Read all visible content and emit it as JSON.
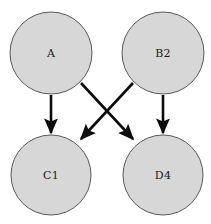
{
  "diagram": {
    "type": "directed-graph",
    "title": "",
    "background_color": "#ffffff",
    "node_fill_color": "#d7d7d7",
    "node_stroke_color": "#5a5a5a",
    "edge_color": "#0d0d0d",
    "label_color": "#1a1a1a",
    "nodes": [
      {
        "id": "A",
        "label": "A",
        "cx": 51,
        "cy": 53,
        "r": 41
      },
      {
        "id": "B2",
        "label": "B2",
        "cx": 163,
        "cy": 53,
        "r": 41
      },
      {
        "id": "C1",
        "label": "C1",
        "cx": 51,
        "cy": 175,
        "r": 40
      },
      {
        "id": "D4",
        "label": "D4",
        "cx": 163,
        "cy": 175,
        "r": 40
      }
    ],
    "edges": [
      {
        "from": "A",
        "to": "C1",
        "x1": 51,
        "y1": 95,
        "x2": 51,
        "y2": 133
      },
      {
        "from": "A",
        "to": "D4",
        "x1": 81,
        "y1": 83,
        "x2": 133,
        "y2": 139
      },
      {
        "from": "B2",
        "to": "C1",
        "x1": 133,
        "y1": 83,
        "x2": 81,
        "y2": 139
      },
      {
        "from": "B2",
        "to": "D4",
        "x1": 163,
        "y1": 95,
        "x2": 163,
        "y2": 133
      }
    ]
  }
}
